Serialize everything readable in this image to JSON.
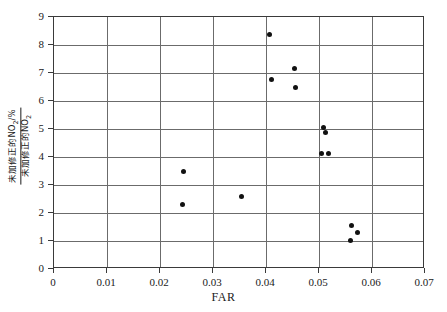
{
  "chart_data": {
    "type": "scatter",
    "title": "",
    "xlabel": "FAR",
    "ylabel_numerator": "未加修正的NO",
    "ylabel_numerator_sub": "2",
    "ylabel_numerator_unit": "/%",
    "ylabel_denominator": "未加修正的NO",
    "ylabel_denominator_sub": "2",
    "xlim": [
      0,
      0.07
    ],
    "ylim": [
      0,
      9
    ],
    "xticks": [
      "0",
      "0.01",
      "0.02",
      "0.03",
      "0.04",
      "0.05",
      "0.06",
      "0.07"
    ],
    "xtick_values": [
      0,
      0.01,
      0.02,
      0.03,
      0.04,
      0.05,
      0.06,
      0.07
    ],
    "yticks": [
      "0",
      "1",
      "2",
      "3",
      "4",
      "5",
      "6",
      "7",
      "8",
      "9"
    ],
    "ytick_values": [
      0,
      1,
      2,
      3,
      4,
      5,
      6,
      7,
      8,
      9
    ],
    "grid": true,
    "legend": false,
    "marker": "filled-circle",
    "marker_color": "#111111",
    "grid_color": "#6b6b6b",
    "frame_color": "#3a3a3a",
    "points": [
      {
        "x": 0.0407,
        "y": 8.38
      },
      {
        "x": 0.0453,
        "y": 7.15
      },
      {
        "x": 0.041,
        "y": 6.76
      },
      {
        "x": 0.0455,
        "y": 6.5
      },
      {
        "x": 0.0508,
        "y": 5.07
      },
      {
        "x": 0.0513,
        "y": 4.87
      },
      {
        "x": 0.0504,
        "y": 4.12
      },
      {
        "x": 0.0517,
        "y": 4.13
      },
      {
        "x": 0.0244,
        "y": 3.49
      },
      {
        "x": 0.0353,
        "y": 2.59
      },
      {
        "x": 0.0243,
        "y": 2.3
      },
      {
        "x": 0.0562,
        "y": 1.54
      },
      {
        "x": 0.0573,
        "y": 1.29
      },
      {
        "x": 0.0559,
        "y": 1.03
      }
    ]
  }
}
